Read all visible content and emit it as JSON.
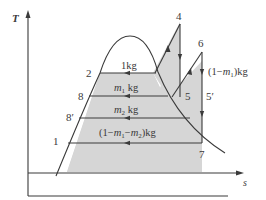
{
  "diagram": {
    "type": "T-s diagram",
    "title": "",
    "axes": {
      "y_label": "T",
      "x_label": "s"
    },
    "colors": {
      "line": "#3a3a3a",
      "fill": "#d6d6d6",
      "background": "#ffffff"
    },
    "state_points": {
      "p1": "1",
      "p2": "2",
      "p4": "4",
      "p5": "5",
      "p5prime": "5′",
      "p6": "6",
      "p7": "7",
      "p8": "8",
      "p8prime": "8′"
    },
    "mass_labels": {
      "top": "1kg",
      "m1_prefix": "m",
      "m1_sub": "1",
      "m1_suffix": " kg",
      "m2_prefix": "m",
      "m2_sub": "2",
      "m2_suffix": " kg",
      "bottom_open": "(1−",
      "bottom_m1": "m",
      "bottom_sub1": "1",
      "bottom_mid": "−",
      "bottom_m2": "m",
      "bottom_sub2": "2",
      "bottom_close": ")kg",
      "reheat_open": "(1−",
      "reheat_m": "m",
      "reheat_sub": "1",
      "reheat_close": ")kg"
    }
  }
}
